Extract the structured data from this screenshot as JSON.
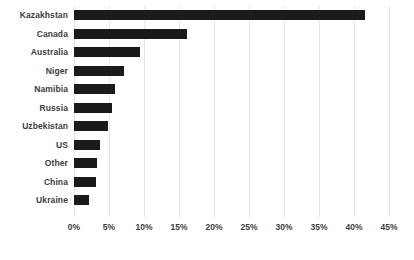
{
  "chart_data": {
    "type": "bar",
    "orientation": "horizontal",
    "title": "",
    "xlabel": "",
    "ylabel": "",
    "categories": [
      "Kazakhstan",
      "Canada",
      "Australia",
      "Niger",
      "Namibia",
      "Russia",
      "Uzbekistan",
      "US",
      "Other",
      "China",
      "Ukraine"
    ],
    "values": [
      41.5,
      16.1,
      9.4,
      7.2,
      5.8,
      5.4,
      4.8,
      3.7,
      3.3,
      3.1,
      2.2
    ],
    "value_format": "percent",
    "xlim": [
      0,
      45
    ],
    "xticks": [
      0,
      5,
      10,
      15,
      20,
      25,
      30,
      35,
      40,
      45
    ],
    "xtick_labels": [
      "0%",
      "5%",
      "10%",
      "15%",
      "20%",
      "25%",
      "30%",
      "35%",
      "40%",
      "45%"
    ],
    "grid": "vertical",
    "legend": "none",
    "bar_color": "#1a1a1a",
    "gridline_color": "#e6e6e6",
    "background_color": "#ffffff",
    "text_color": "#3d3d3d"
  }
}
